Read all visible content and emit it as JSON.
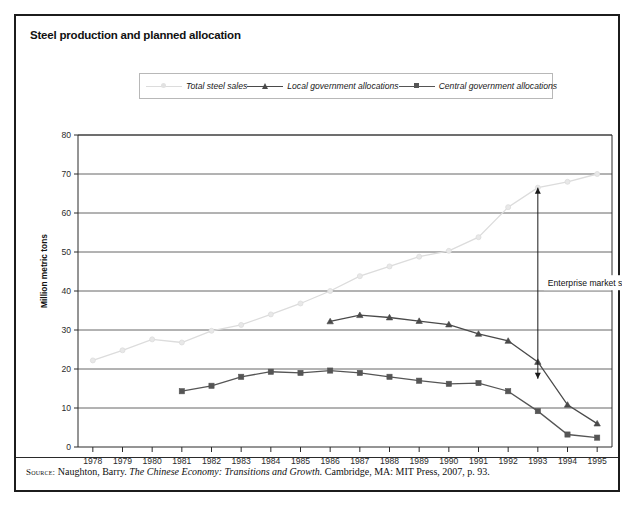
{
  "figure": {
    "title": "Steel production and planned allocation",
    "source": {
      "keyword": "Source:",
      "author": "Naughton, Barry.",
      "work": "The Chinese Economy: Transitions and Growth.",
      "publication": "Cambridge, MA: MIT Press, 2007, p. 93."
    }
  },
  "colors": {
    "total_steel_sales": "#dcdcdc",
    "local_government": "#4a4a4a",
    "central_government": "#555555",
    "axis": "#2a2a2a",
    "gridline": "#666666",
    "frame": "#1c1c1c",
    "legend_border": "#b8b8b8"
  },
  "chart_data": {
    "type": "line",
    "title": "Steel production and planned allocation",
    "xlabel": "",
    "ylabel": "Million metric tons",
    "ylim": [
      0,
      80
    ],
    "yticks": [
      0,
      10,
      20,
      30,
      40,
      50,
      60,
      70,
      80
    ],
    "grid": "horizontal",
    "legend_position": "top-center",
    "categories": [
      "1978",
      "1979",
      "1980",
      "1981",
      "1982",
      "1983",
      "1984",
      "1985",
      "1986",
      "1987",
      "1988",
      "1989",
      "1990",
      "1991",
      "1992",
      "1993",
      "1994",
      "1995"
    ],
    "series": [
      {
        "name": "Total steel sales",
        "marker": "dot",
        "color": "#dcdcdc",
        "values": [
          22.2,
          24.8,
          27.6,
          26.8,
          29.8,
          31.3,
          34.0,
          36.8,
          40.0,
          43.8,
          46.3,
          48.8,
          50.3,
          53.8,
          61.5,
          66.5,
          68.0,
          70.0
        ]
      },
      {
        "name": "Local government allocations",
        "marker": "triangle",
        "color": "#4a4a4a",
        "values": [
          null,
          null,
          null,
          null,
          null,
          null,
          null,
          null,
          32.2,
          33.8,
          33.2,
          32.3,
          31.4,
          29.0,
          27.2,
          21.8,
          10.8,
          6.0
        ]
      },
      {
        "name": "Central government allocations",
        "marker": "square",
        "color": "#555555",
        "values": [
          null,
          null,
          null,
          14.3,
          15.7,
          18.0,
          19.3,
          19.0,
          19.6,
          19.0,
          18.0,
          17.0,
          16.2,
          16.4,
          14.3,
          9.2,
          3.2,
          2.4
        ]
      }
    ],
    "annotations": [
      {
        "text": "Enterprise market sales",
        "type": "double-arrow",
        "at_category": "1993",
        "y_top": 66.5,
        "y_bottom": 17.5
      }
    ]
  }
}
